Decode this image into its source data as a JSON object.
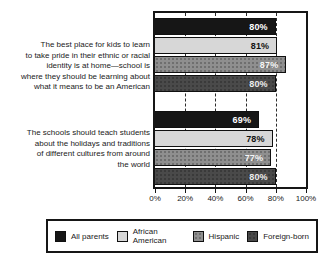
{
  "chart_data": {
    "type": "bar",
    "orientation": "horizontal",
    "title": "",
    "xlabel": "",
    "ylabel": "",
    "x_axis": {
      "min": 0,
      "max": 100,
      "tick_labels": [
        "0%",
        "20%",
        "40%",
        "60%",
        "80%",
        "100%"
      ],
      "gridline_values": [
        20,
        40,
        60,
        80
      ],
      "grid_style": "dashed"
    },
    "legend_position": "bottom",
    "series": [
      {
        "name": "All parents",
        "color": "#161616",
        "label_color": "#ffffff",
        "texture": "solid"
      },
      {
        "name": "African American",
        "color": "#d7d7d7",
        "label_color": "#111111",
        "texture": "solid"
      },
      {
        "name": "Hispanic",
        "color": "#8f8f8f",
        "label_color": "#f5f5f5",
        "texture": "dots-dark"
      },
      {
        "name": "Foreign-born",
        "color": "#4a4a4a",
        "label_color": "#ededed",
        "texture": "dots-light"
      }
    ],
    "groups": [
      {
        "label": "The best place for kids to learn to take pride in their ethnic or racial identity is at home—school is where they should be learning about what it means to be an American",
        "label_lines": [
          "The best place for kids to learn",
          "to take pride in their ethnic or racial",
          "identity is at home—school is",
          "where they should be learning about",
          "what it means to be an American"
        ],
        "values": [
          80,
          81,
          87,
          80
        ],
        "values_display": [
          "80%",
          "81%",
          "87%",
          "80%"
        ]
      },
      {
        "label": "The schools should teach students about the holidays and traditions of different cultures from around the world",
        "label_lines": [
          "The schools should teach students",
          "about the holidays and traditions",
          "of different cultures from around",
          "the world"
        ],
        "values": [
          69,
          78,
          77,
          80
        ],
        "values_display": [
          "69%",
          "78%",
          "77%",
          "80%"
        ]
      }
    ],
    "colors": {
      "frame": "#161616",
      "background": "#ffffff",
      "gridline": "#2b2b2b"
    }
  }
}
